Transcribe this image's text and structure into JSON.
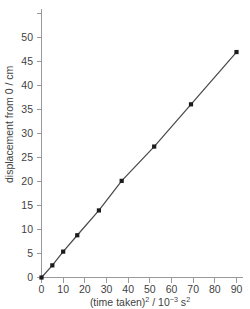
{
  "chart_data": {
    "type": "line",
    "title": "",
    "subtitle": "",
    "xlabel": "(time taken)2 / 10-3 s2",
    "xlabel_parts": {
      "base1": "(time taken)",
      "sup1": "2",
      "mid": " / 10",
      "sup2": "−3",
      "base2": " s",
      "sup3": "2"
    },
    "ylabel": "displacement from 0 / cm",
    "xlim": [
      0,
      95
    ],
    "ylim": [
      0,
      52
    ],
    "xticks": [
      0,
      10,
      20,
      30,
      40,
      50,
      60,
      70,
      80,
      90
    ],
    "yticks": [
      0,
      5,
      10,
      15,
      20,
      25,
      30,
      35,
      40,
      45,
      50
    ],
    "grid": false,
    "legend": "none",
    "series": [
      {
        "name": "displacement vs (time taken) squared",
        "marker": "filled-square",
        "line_color": "#4a4a4a",
        "marker_color": "#1c1c1c",
        "x": [
          0,
          5,
          10,
          16.5,
          26.5,
          37,
          52,
          69,
          90
        ],
        "y": [
          0,
          2.3,
          4.9,
          8.0,
          12.7,
          18.3,
          24.8,
          32.8,
          42.7
        ]
      }
    ],
    "axis_color": "#9a9a9a",
    "tick_label_color": "#3f3f3f",
    "background_color": "#ffffff"
  }
}
